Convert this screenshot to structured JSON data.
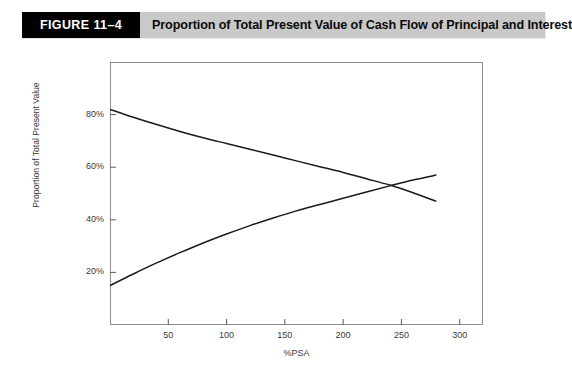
{
  "header": {
    "figure_number": "FIGURE 11–4",
    "title": "Proportion of Total Present Value of Cash Flow of Principal and Interest",
    "number_box_color": "#000000",
    "bar_color": "#c9c9c9",
    "text_color": "#000000"
  },
  "chart_data": {
    "type": "line",
    "title": "Proportion of Total Present Value of Cash Flow of Principal and Interest",
    "xlabel": "%PSA",
    "ylabel": "Proportion of Total Present Value",
    "xlim": [
      0,
      320
    ],
    "ylim": [
      0,
      100
    ],
    "xticks": [
      50,
      100,
      150,
      200,
      250,
      300
    ],
    "xtick_labels": [
      "50",
      "100",
      "150",
      "200",
      "250",
      "300"
    ],
    "yticks": [
      20,
      40,
      60,
      80
    ],
    "ytick_labels": [
      "20%",
      "40%",
      "60%",
      "80%"
    ],
    "grid": false,
    "legend": null,
    "curve_color": "#1a1a1a",
    "series": [
      {
        "name": "Principal",
        "x": [
          0,
          20,
          40,
          60,
          80,
          100,
          120,
          140,
          160,
          180,
          200,
          220,
          240,
          260,
          280
        ],
        "values": [
          82.0,
          79.0,
          76.2,
          73.6,
          71.2,
          69.0,
          66.8,
          64.6,
          62.4,
          60.2,
          58.0,
          55.6,
          53.2,
          50.3,
          47.0
        ]
      },
      {
        "name": "Interest",
        "x": [
          0,
          20,
          40,
          60,
          80,
          100,
          120,
          140,
          160,
          180,
          200,
          220,
          240,
          260,
          280
        ],
        "values": [
          15.0,
          19.4,
          23.6,
          27.5,
          31.2,
          34.6,
          37.8,
          40.7,
          43.4,
          45.8,
          48.2,
          50.6,
          52.9,
          55.1,
          57.0
        ]
      }
    ],
    "crossing_point": {
      "x": 195,
      "y": 52
    }
  }
}
